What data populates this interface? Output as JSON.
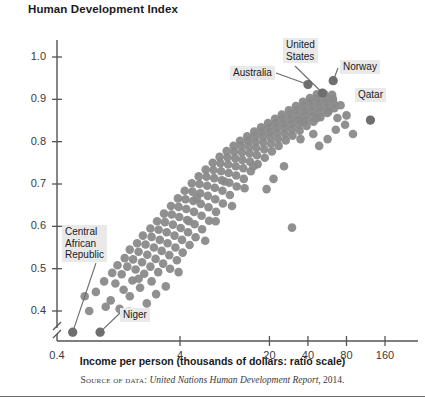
{
  "figure": {
    "title": "Human Development Index",
    "x_axis_title": "Income per person (thousands of dollars: ratio scale)",
    "source_prefix": "Source of data:",
    "source_italic": "United Nations Human Development Report",
    "source_suffix": ", 2014.",
    "dot_color": "#8a8a8a",
    "axis_color": "#555555",
    "callout_bg": "#e9e9e9"
  },
  "chart_data": {
    "type": "scatter",
    "title": "Human Development Index",
    "xlabel": "Income per person (thousands of dollars: ratio scale)",
    "ylabel": "Human Development Index",
    "xscale": "log",
    "grid": false,
    "legend": "none",
    "xticks": [
      "0.4",
      "4",
      "20",
      "40",
      "80",
      "160"
    ],
    "xtick_values": [
      0.4,
      4,
      20,
      40,
      80,
      160
    ],
    "yticks": [
      "0.4",
      "0.5",
      "0.6",
      "0.7",
      "0.8",
      "0.9",
      "1.0"
    ],
    "ytick_values": [
      0.4,
      0.5,
      0.6,
      0.7,
      0.8,
      0.9,
      1.0
    ],
    "ylim": [
      0.33,
      1.04
    ],
    "y_axis_break": true,
    "annotations": [
      {
        "label": "Central African Republic",
        "x": 0.58,
        "y": 0.35
      },
      {
        "label": "Niger",
        "x": 0.95,
        "y": 0.35
      },
      {
        "label": "Australia",
        "x": 40.0,
        "y": 0.935
      },
      {
        "label": "United States",
        "x": 52.0,
        "y": 0.915
      },
      {
        "label": "Norway",
        "x": 63.0,
        "y": 0.944
      },
      {
        "label": "Qatar",
        "x": 123.0,
        "y": 0.851
      }
    ],
    "points": [
      [
        0.58,
        0.35
      ],
      [
        0.95,
        0.35
      ],
      [
        0.78,
        0.4
      ],
      [
        1.05,
        0.41
      ],
      [
        0.72,
        0.435
      ],
      [
        0.88,
        0.445
      ],
      [
        1.15,
        0.425
      ],
      [
        1.35,
        0.405
      ],
      [
        1.02,
        0.47
      ],
      [
        1.25,
        0.465
      ],
      [
        1.45,
        0.45
      ],
      [
        1.62,
        0.435
      ],
      [
        1.18,
        0.49
      ],
      [
        1.4,
        0.487
      ],
      [
        1.7,
        0.472
      ],
      [
        1.95,
        0.455
      ],
      [
        1.3,
        0.508
      ],
      [
        1.55,
        0.505
      ],
      [
        1.8,
        0.498
      ],
      [
        2.1,
        0.488
      ],
      [
        2.4,
        0.47
      ],
      [
        1.48,
        0.525
      ],
      [
        1.72,
        0.522
      ],
      [
        2.02,
        0.515
      ],
      [
        2.35,
        0.505
      ],
      [
        2.7,
        0.492
      ],
      [
        1.62,
        0.545
      ],
      [
        1.9,
        0.54
      ],
      [
        2.22,
        0.533
      ],
      [
        2.58,
        0.523
      ],
      [
        2.95,
        0.512
      ],
      [
        3.35,
        0.5
      ],
      [
        1.85,
        0.56
      ],
      [
        2.15,
        0.557
      ],
      [
        2.5,
        0.55
      ],
      [
        2.88,
        0.542
      ],
      [
        3.3,
        0.532
      ],
      [
        3.78,
        0.52
      ],
      [
        2.05,
        0.578
      ],
      [
        2.4,
        0.575
      ],
      [
        2.78,
        0.568
      ],
      [
        3.2,
        0.56
      ],
      [
        3.68,
        0.55
      ],
      [
        4.2,
        0.538
      ],
      [
        2.35,
        0.595
      ],
      [
        2.72,
        0.592
      ],
      [
        3.15,
        0.586
      ],
      [
        3.62,
        0.578
      ],
      [
        4.15,
        0.568
      ],
      [
        4.75,
        0.556
      ],
      [
        2.65,
        0.612
      ],
      [
        3.05,
        0.61
      ],
      [
        3.52,
        0.604
      ],
      [
        4.05,
        0.596
      ],
      [
        4.62,
        0.586
      ],
      [
        5.3,
        0.574
      ],
      [
        3.0,
        0.63
      ],
      [
        3.45,
        0.628
      ],
      [
        3.95,
        0.622
      ],
      [
        4.55,
        0.615
      ],
      [
        5.2,
        0.605
      ],
      [
        5.95,
        0.593
      ],
      [
        3.4,
        0.648
      ],
      [
        3.9,
        0.646
      ],
      [
        4.48,
        0.641
      ],
      [
        5.15,
        0.634
      ],
      [
        5.9,
        0.625
      ],
      [
        6.75,
        0.613
      ],
      [
        3.85,
        0.666
      ],
      [
        4.42,
        0.664
      ],
      [
        5.08,
        0.66
      ],
      [
        5.82,
        0.653
      ],
      [
        6.68,
        0.645
      ],
      [
        7.65,
        0.634
      ],
      [
        4.35,
        0.684
      ],
      [
        5.0,
        0.682
      ],
      [
        5.75,
        0.678
      ],
      [
        6.6,
        0.672
      ],
      [
        7.55,
        0.664
      ],
      [
        8.65,
        0.654
      ],
      [
        4.95,
        0.702
      ],
      [
        5.68,
        0.7
      ],
      [
        6.52,
        0.696
      ],
      [
        7.48,
        0.691
      ],
      [
        8.58,
        0.684
      ],
      [
        9.82,
        0.674
      ],
      [
        5.6,
        0.718
      ],
      [
        6.44,
        0.717
      ],
      [
        7.4,
        0.714
      ],
      [
        8.48,
        0.709
      ],
      [
        9.72,
        0.703
      ],
      [
        11.1,
        0.694
      ],
      [
        6.35,
        0.734
      ],
      [
        7.3,
        0.733
      ],
      [
        8.38,
        0.73
      ],
      [
        9.6,
        0.726
      ],
      [
        11.0,
        0.72
      ],
      [
        12.6,
        0.712
      ],
      [
        7.2,
        0.75
      ],
      [
        8.28,
        0.749
      ],
      [
        9.5,
        0.746
      ],
      [
        10.9,
        0.742
      ],
      [
        12.5,
        0.737
      ],
      [
        14.3,
        0.73
      ],
      [
        8.15,
        0.764
      ],
      [
        9.38,
        0.763
      ],
      [
        10.8,
        0.761
      ],
      [
        12.3,
        0.757
      ],
      [
        14.1,
        0.753
      ],
      [
        16.2,
        0.747
      ],
      [
        9.25,
        0.778
      ],
      [
        10.6,
        0.777
      ],
      [
        12.2,
        0.775
      ],
      [
        14.0,
        0.772
      ],
      [
        16.0,
        0.768
      ],
      [
        18.4,
        0.762
      ],
      [
        10.5,
        0.79
      ],
      [
        12.0,
        0.79
      ],
      [
        13.8,
        0.788
      ],
      [
        15.8,
        0.785
      ],
      [
        18.2,
        0.782
      ],
      [
        20.9,
        0.777
      ],
      [
        11.8,
        0.802
      ],
      [
        13.6,
        0.802
      ],
      [
        15.6,
        0.8
      ],
      [
        17.9,
        0.798
      ],
      [
        20.6,
        0.795
      ],
      [
        23.6,
        0.79
      ],
      [
        13.4,
        0.813
      ],
      [
        15.4,
        0.813
      ],
      [
        17.7,
        0.812
      ],
      [
        20.3,
        0.81
      ],
      [
        23.3,
        0.807
      ],
      [
        26.8,
        0.803
      ],
      [
        15.2,
        0.824
      ],
      [
        17.4,
        0.824
      ],
      [
        20.0,
        0.823
      ],
      [
        23.0,
        0.821
      ],
      [
        26.4,
        0.818
      ],
      [
        30.3,
        0.814
      ],
      [
        17.2,
        0.834
      ],
      [
        19.8,
        0.834
      ],
      [
        22.7,
        0.833
      ],
      [
        26.1,
        0.832
      ],
      [
        30.0,
        0.829
      ],
      [
        34.4,
        0.826
      ],
      [
        19.5,
        0.844
      ],
      [
        22.4,
        0.844
      ],
      [
        25.7,
        0.843
      ],
      [
        29.6,
        0.842
      ],
      [
        34.0,
        0.84
      ],
      [
        39.0,
        0.837
      ],
      [
        22.1,
        0.854
      ],
      [
        25.4,
        0.854
      ],
      [
        29.2,
        0.853
      ],
      [
        33.5,
        0.852
      ],
      [
        38.5,
        0.85
      ],
      [
        44.2,
        0.847
      ],
      [
        25.0,
        0.864
      ],
      [
        28.8,
        0.864
      ],
      [
        33.1,
        0.863
      ],
      [
        38.0,
        0.862
      ],
      [
        43.6,
        0.86
      ],
      [
        50.1,
        0.858
      ],
      [
        28.4,
        0.874
      ],
      [
        32.6,
        0.874
      ],
      [
        37.5,
        0.873
      ],
      [
        43.0,
        0.872
      ],
      [
        49.4,
        0.871
      ],
      [
        56.7,
        0.868
      ],
      [
        32.2,
        0.884
      ],
      [
        37.0,
        0.884
      ],
      [
        42.5,
        0.883
      ],
      [
        48.8,
        0.882
      ],
      [
        56.0,
        0.881
      ],
      [
        64.3,
        0.879
      ],
      [
        36.5,
        0.894
      ],
      [
        41.9,
        0.894
      ],
      [
        48.1,
        0.893
      ],
      [
        55.3,
        0.892
      ],
      [
        63.4,
        0.891
      ],
      [
        41.4,
        0.903
      ],
      [
        47.5,
        0.903
      ],
      [
        54.6,
        0.902
      ],
      [
        62.6,
        0.901
      ],
      [
        46.9,
        0.912
      ],
      [
        53.9,
        0.912
      ],
      [
        61.8,
        0.911
      ],
      [
        40.0,
        0.935
      ],
      [
        52.0,
        0.915
      ],
      [
        63.0,
        0.944
      ],
      [
        123.0,
        0.851
      ],
      [
        72.0,
        0.886
      ],
      [
        80.0,
        0.862
      ],
      [
        58.0,
        0.872
      ],
      [
        47.0,
        0.856
      ],
      [
        36.0,
        0.848
      ],
      [
        30.0,
        0.597
      ],
      [
        21.5,
        0.712
      ],
      [
        26.0,
        0.742
      ],
      [
        19.0,
        0.688
      ],
      [
        15.0,
        0.742
      ],
      [
        12.8,
        0.69
      ],
      [
        10.2,
        0.648
      ],
      [
        8.9,
        0.706
      ],
      [
        7.6,
        0.612
      ],
      [
        6.3,
        0.566
      ],
      [
        5.4,
        0.666
      ],
      [
        4.7,
        0.612
      ],
      [
        3.9,
        0.492
      ],
      [
        3.1,
        0.458
      ],
      [
        2.6,
        0.44
      ],
      [
        2.2,
        0.418
      ],
      [
        1.9,
        0.476
      ],
      [
        1.6,
        0.398
      ],
      [
        66.0,
        0.828
      ],
      [
        57.0,
        0.806
      ],
      [
        49.0,
        0.79
      ],
      [
        44.0,
        0.818
      ],
      [
        35.0,
        0.806
      ],
      [
        90.0,
        0.818
      ],
      [
        78.0,
        0.84
      ],
      [
        68.0,
        0.856
      ]
    ]
  }
}
